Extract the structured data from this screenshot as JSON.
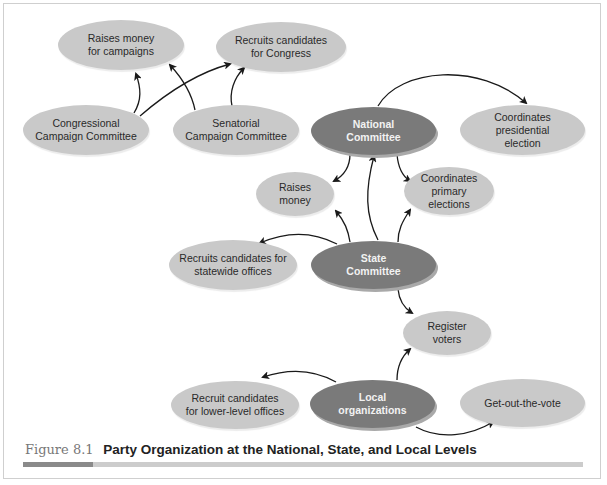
{
  "figure": {
    "number": "Figure 8.1",
    "title": "Party Organization at the National, State, and Local Levels"
  },
  "colors": {
    "node_light": "#c9c9c9",
    "node_dark": "#7a7a7a",
    "arrow": "#1a1a1a",
    "caption_rule_dark": "#8a8a8a",
    "caption_rule_light": "#cccccc"
  },
  "nodes": {
    "raises_money_campaigns": "Raises money\nfor campaigns",
    "recruits_congress": "Recruits candidates\nfor Congress",
    "congressional_cc": "Congressional\nCampaign Committee",
    "senatorial_cc": "Senatorial\nCampaign Committee",
    "national_committee": "National\nCommittee",
    "coord_presidential": "Coordinates\npresidential\nelection",
    "raises_money": "Raises\nmoney",
    "coord_primary": "Coordinates\nprimary\nelections",
    "recruits_statewide": "Recruits candidates for\nstatewide offices",
    "state_committee": "State\nCommittee",
    "register_voters": "Register\nvoters",
    "recruit_lower": "Recruit candidates\nfor lower-level offices",
    "local_orgs": "Local\norganizations",
    "gotv": "Get-out-the-vote"
  },
  "edges": [
    {
      "from": "Congressional Campaign Committee",
      "to": "Raises money for campaigns"
    },
    {
      "from": "Congressional Campaign Committee",
      "to": "Recruits candidates for Congress"
    },
    {
      "from": "Senatorial Campaign Committee",
      "to": "Raises money for campaigns"
    },
    {
      "from": "Senatorial Campaign Committee",
      "to": "Recruits candidates for Congress"
    },
    {
      "from": "National Committee",
      "to": "Coordinates presidential election"
    },
    {
      "from": "National Committee",
      "to": "Raises money"
    },
    {
      "from": "National Committee",
      "to": "Coordinates primary elections"
    },
    {
      "from": "State Committee",
      "to": "National Committee"
    },
    {
      "from": "State Committee",
      "to": "Raises money"
    },
    {
      "from": "State Committee",
      "to": "Coordinates primary elections"
    },
    {
      "from": "State Committee",
      "to": "Recruits candidates for statewide offices"
    },
    {
      "from": "State Committee",
      "to": "Register voters"
    },
    {
      "from": "Local organizations",
      "to": "Register voters"
    },
    {
      "from": "Local organizations",
      "to": "Recruit candidates for lower-level offices"
    },
    {
      "from": "Local organizations",
      "to": "Get-out-the-vote"
    }
  ]
}
